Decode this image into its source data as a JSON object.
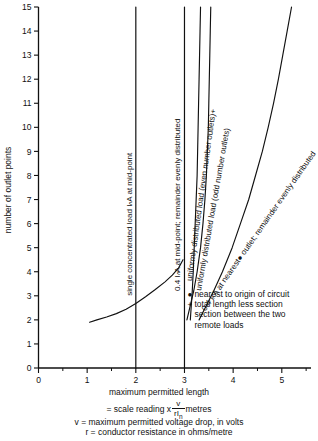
{
  "chart_data": {
    "type": "line",
    "title": "",
    "xlabel": "maximum permitted length",
    "ylabel": "number of outlet points",
    "xlim": [
      0,
      5.6
    ],
    "ylim": [
      0,
      15
    ],
    "xticks": [
      0,
      1,
      2,
      3,
      4,
      5
    ],
    "yticks": [
      0,
      1,
      2,
      3,
      4,
      5,
      6,
      7,
      8,
      9,
      10,
      11,
      12,
      13,
      14,
      15
    ],
    "xminor_step": 0.5,
    "grid": false,
    "legend": "inline-rotated-labels",
    "series": [
      {
        "name": "single concentrated load IₙA at mid-point",
        "kind": "vertical-line",
        "x_constant": 2.0,
        "points": [
          [
            2.0,
            0
          ],
          [
            2.0,
            15
          ]
        ]
      },
      {
        "name": "0.4 IₙA at mid-point; remainder evenly distributed",
        "kind": "vertical-line",
        "x_constant": 3.0,
        "points": [
          [
            3.0,
            0
          ],
          [
            3.0,
            15
          ]
        ]
      },
      {
        "name": "uniformly distributed load (even number outlets)",
        "kind": "curve",
        "footnote_marker": "+",
        "points": [
          [
            3.12,
            2.0
          ],
          [
            3.14,
            2.6
          ],
          [
            3.16,
            3.2
          ],
          [
            3.18,
            4.0
          ],
          [
            3.2,
            5.0
          ],
          [
            3.22,
            6.0
          ],
          [
            3.24,
            7.0
          ],
          [
            3.26,
            8.0
          ],
          [
            3.27,
            9.0
          ],
          [
            3.28,
            10.0
          ],
          [
            3.29,
            11.0
          ],
          [
            3.3,
            12.0
          ],
          [
            3.31,
            13.0
          ],
          [
            3.32,
            14.0
          ],
          [
            3.33,
            15.0
          ]
        ]
      },
      {
        "name": "uniformly distributed load (odd number outlets)",
        "kind": "curve",
        "points": [
          [
            3.05,
            2.0
          ],
          [
            3.12,
            2.6
          ],
          [
            3.19,
            3.2
          ],
          [
            3.26,
            4.0
          ],
          [
            3.33,
            5.0
          ],
          [
            3.38,
            6.0
          ],
          [
            3.42,
            7.0
          ],
          [
            3.45,
            8.0
          ],
          [
            3.47,
            9.0
          ],
          [
            3.49,
            10.0
          ],
          [
            3.5,
            11.0
          ],
          [
            3.51,
            12.0
          ],
          [
            3.52,
            13.0
          ],
          [
            3.53,
            14.0
          ],
          [
            3.54,
            15.0
          ]
        ]
      },
      {
        "name": "0.4 IₙA at nearest● outlet; remainder evenly distributed",
        "kind": "curve",
        "footnote_marker": "●",
        "points": [
          [
            3.3,
            2.0
          ],
          [
            3.45,
            2.6
          ],
          [
            3.6,
            3.2
          ],
          [
            3.78,
            4.0
          ],
          [
            3.98,
            5.0
          ],
          [
            4.15,
            6.0
          ],
          [
            4.32,
            7.0
          ],
          [
            4.46,
            8.0
          ],
          [
            4.6,
            9.0
          ],
          [
            4.72,
            10.0
          ],
          [
            4.83,
            11.0
          ],
          [
            4.93,
            12.0
          ],
          [
            5.02,
            13.0
          ],
          [
            5.11,
            14.0
          ],
          [
            5.2,
            15.0
          ]
        ]
      },
      {
        "name": "unlabelled lower curve",
        "kind": "curve",
        "points": [
          [
            1.05,
            1.9
          ],
          [
            1.2,
            2.0
          ],
          [
            1.4,
            2.12
          ],
          [
            1.6,
            2.26
          ],
          [
            1.8,
            2.44
          ],
          [
            2.0,
            2.68
          ],
          [
            2.2,
            2.96
          ],
          [
            2.4,
            3.26
          ],
          [
            2.6,
            3.58
          ],
          [
            2.75,
            3.86
          ],
          [
            2.88,
            4.16
          ],
          [
            2.97,
            4.5
          ]
        ]
      }
    ]
  },
  "footnotes": {
    "items": [
      {
        "marker": "●",
        "text": "nearest to origin of circuit"
      },
      {
        "marker": "+",
        "text": "total length less section"
      },
      {
        "marker": "",
        "text": "section between the two"
      },
      {
        "marker": "",
        "text": "remote loads"
      }
    ]
  },
  "caption": {
    "line1": "maximum permitted length",
    "line2_prefix": "= scale reading x",
    "line2_num": "v",
    "line2_den": "rI",
    "line2_den_sub": "n",
    "line2_suffix": "metres",
    "line3": "v = maximum permitted voltage drop, in volts",
    "line4": "r = conductor resistance in ohms/metre"
  },
  "colors": {
    "ink": "#111111",
    "background": "#ffffff"
  }
}
